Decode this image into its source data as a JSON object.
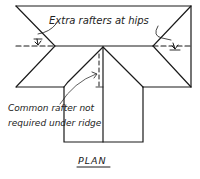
{
  "diagram": {
    "title": "PLAN",
    "labels": {
      "hips_note": "Extra rafters at hips",
      "common_note_line1": "Common rafter not",
      "common_note_line2": "required under ridge"
    },
    "colors": {
      "ink": "#1a1a1a",
      "background": "#ffffff"
    }
  }
}
